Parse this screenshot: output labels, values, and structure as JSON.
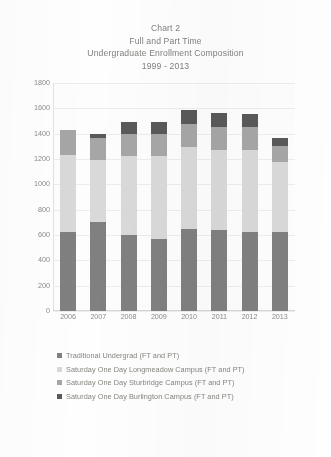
{
  "title": {
    "line1": "Chart 2",
    "line2": "Full and Part Time",
    "line3": "Undergraduate Enrollment Composition",
    "line4": "1999 - 2013"
  },
  "colors": {
    "traditional_undergrad": "#808080",
    "longmeadow": "#d9d9d9",
    "sturbridge": "#a6a6a6",
    "burlington": "#595959",
    "gridline": "#ededed",
    "axis_text": "#8a8a8a",
    "title_text": "#82807e",
    "plot_background": "#fdfdfd"
  },
  "chart_data": {
    "type": "bar",
    "stacked": true,
    "xlabel": "",
    "ylabel": "",
    "ylim": [
      0,
      1800
    ],
    "ytick_step": 200,
    "yticks": [
      1800,
      1600,
      1400,
      1200,
      1000,
      800,
      600,
      400,
      200,
      0
    ],
    "grid": true,
    "legend_position": "bottom-left",
    "categories": [
      "2006",
      "2007",
      "2008",
      "2009",
      "2010",
      "2011",
      "2012",
      "2013"
    ],
    "series": [
      {
        "name": "Traditional Undergrad (FT and PT)",
        "color": "#808080",
        "values": [
          625,
          700,
          600,
          565,
          645,
          640,
          625,
          625
        ]
      },
      {
        "name": "Saturday One Day Longmeadow Campus (FT and PT)",
        "color": "#d9d9d9",
        "values": [
          610,
          490,
          620,
          660,
          650,
          635,
          650,
          555
        ]
      },
      {
        "name": "Saturday One Day Sturbridge Campus (FT and PT)",
        "color": "#a6a6a6",
        "values": [
          195,
          175,
          180,
          170,
          180,
          180,
          180,
          120
        ]
      },
      {
        "name": "Saturday One Day Burlington Campus (FT and PT)",
        "color": "#595959",
        "values": [
          0,
          30,
          90,
          95,
          115,
          110,
          100,
          65
        ]
      }
    ],
    "totals": [
      1430,
      1395,
      1490,
      1490,
      1590,
      1565,
      1555,
      1365
    ]
  },
  "legend": {
    "items": [
      {
        "label": "Traditional Undergrad (FT and PT)",
        "color": "#808080"
      },
      {
        "label": "Saturday One Day Longmeadow Campus (FT and PT)",
        "color": "#d9d9d9"
      },
      {
        "label": "Saturday One Day Sturbridge Campus (FT and PT)",
        "color": "#a6a6a6"
      },
      {
        "label": "Saturday One Day Burlington Campus (FT and PT)",
        "color": "#595959"
      }
    ]
  }
}
